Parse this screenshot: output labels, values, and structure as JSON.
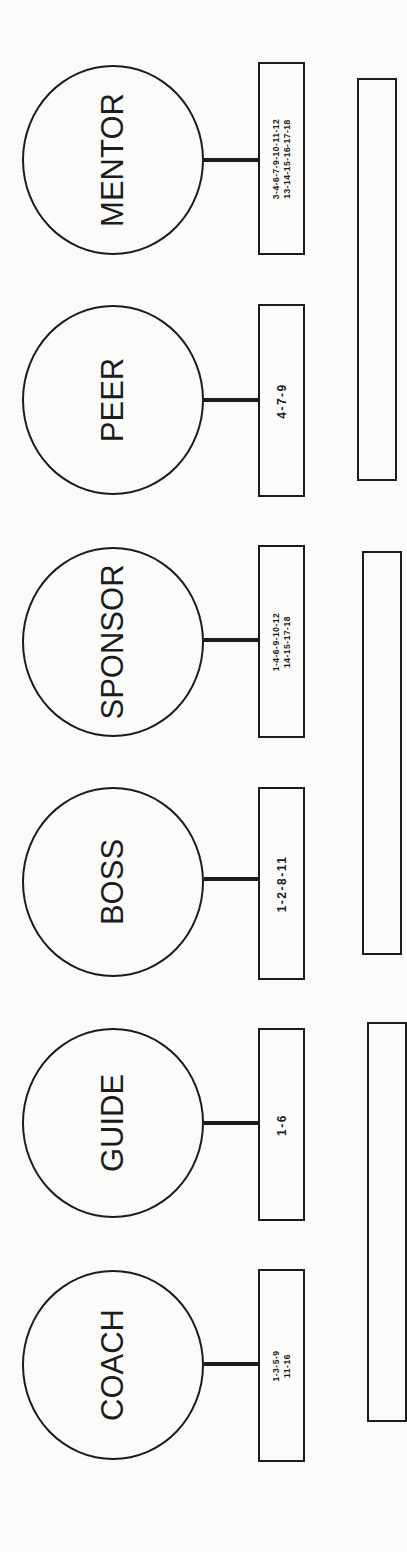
{
  "diagram": {
    "orientation": "rotated-90-ccw",
    "roles": [
      {
        "name": "MENTOR",
        "numbers": [
          "3-4-6-7-9-10-11-12",
          "13-14-15-16-17-18"
        ]
      },
      {
        "name": "PEER",
        "numbers": [
          "4-7-9"
        ]
      },
      {
        "name": "SPONSOR",
        "numbers": [
          "1-4-6-9-10-12",
          "14-15-17-18"
        ]
      },
      {
        "name": "BOSS",
        "numbers": [
          "1-2-8-11"
        ]
      },
      {
        "name": "GUIDE",
        "numbers": [
          "1-6"
        ]
      },
      {
        "name": "COACH",
        "numbers": [
          "1-3-5-9",
          "11-16"
        ]
      }
    ],
    "group_boxes": [
      {
        "spans_roles": [
          "MENTOR",
          "PEER"
        ],
        "content": ""
      },
      {
        "spans_roles": [
          "SPONSOR",
          "BOSS"
        ],
        "content": ""
      },
      {
        "spans_roles": [
          "GUIDE",
          "COACH"
        ],
        "content": ""
      }
    ],
    "colors": {
      "ink": "#1c1c1c",
      "paper": "#fbfbf9"
    }
  }
}
